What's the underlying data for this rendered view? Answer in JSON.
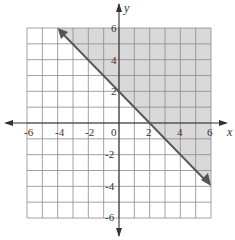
{
  "chart_data": {
    "type": "line",
    "title": "",
    "xlabel": "x",
    "ylabel": "y",
    "xlim": [
      -6,
      6
    ],
    "ylim": [
      -6,
      6
    ],
    "grid": true,
    "x_ticks": [
      "-6",
      "-4",
      "-2",
      "0",
      "2",
      "4",
      "6"
    ],
    "y_ticks": [
      "6",
      "4",
      "2",
      "-2",
      "-4",
      "-6"
    ],
    "series": [
      {
        "name": "boundary line y = -x + 2",
        "x": [
          -4,
          6
        ],
        "y": [
          6,
          -4
        ],
        "style": "solid",
        "arrows": "both"
      }
    ],
    "shaded_region": {
      "description": "region above the line y = -x + 2 (y >= -x + 2)",
      "polygon": [
        [
          -4,
          6
        ],
        [
          6,
          6
        ],
        [
          6,
          -4
        ]
      ],
      "color": "#d9d9d9"
    },
    "colors": {
      "grid": "#888888",
      "axis": "#333333",
      "line": "#555555",
      "shade": "#d9d9d9"
    }
  }
}
